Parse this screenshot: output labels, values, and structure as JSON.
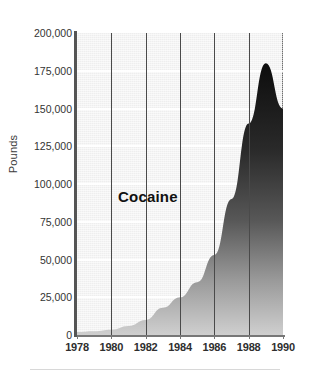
{
  "chart_data": {
    "type": "area",
    "title": "",
    "subtitle": "",
    "series_label": "Cocaine",
    "xlabel": "",
    "ylabel": "Pounds",
    "grid": true,
    "legend_position": "inside-plot",
    "xlim": [
      1978,
      1990
    ],
    "ylim": [
      0,
      200000
    ],
    "x_tick_labels": [
      "1978",
      "1980",
      "1982",
      "1984",
      "1986",
      "1988",
      "1990"
    ],
    "x_ticks": [
      1978,
      1980,
      1982,
      1984,
      1986,
      1988,
      1990
    ],
    "y_tick_labels": [
      "200,000",
      "175,000",
      "150,000",
      "125,000",
      "100,000",
      "75,000",
      "50,000",
      "25,000",
      "0"
    ],
    "y_ticks": [
      200000,
      175000,
      150000,
      125000,
      100000,
      75000,
      50000,
      25000,
      0
    ],
    "series": [
      {
        "name": "Cocaine",
        "x": [
          1978,
          1979,
          1980,
          1981,
          1982,
          1983,
          1984,
          1985,
          1986,
          1987,
          1988,
          1989,
          1990
        ],
        "values": [
          2000,
          2500,
          3500,
          6000,
          10000,
          18000,
          25000,
          35000,
          53000,
          90000,
          140000,
          180000,
          150000
        ]
      }
    ]
  },
  "axis": {
    "y_title": "Pounds",
    "y_ticks": [
      {
        "label": "200,000",
        "value": 200000
      },
      {
        "label": "175,000",
        "value": 175000
      },
      {
        "label": "150,000",
        "value": 150000
      },
      {
        "label": "125,000",
        "value": 125000
      },
      {
        "label": "100,000",
        "value": 100000
      },
      {
        "label": "75,000",
        "value": 75000
      },
      {
        "label": "50,000",
        "value": 50000
      },
      {
        "label": "25,000",
        "value": 25000
      },
      {
        "label": "0",
        "value": 0
      }
    ],
    "x_ticks": [
      {
        "label": "1978",
        "value": 1978
      },
      {
        "label": "1980",
        "value": 1980
      },
      {
        "label": "1982",
        "value": 1982
      },
      {
        "label": "1984",
        "value": 1984
      },
      {
        "label": "1986",
        "value": 1986
      },
      {
        "label": "1988",
        "value": 1988
      },
      {
        "label": "1990",
        "value": 1990
      }
    ]
  },
  "colors": {
    "plot_background": "#eeeeee",
    "gridline_horizontal": "#ffffff",
    "gridline_vertical": "#4a4a4a",
    "area_fill_top": "#111111",
    "area_fill_bottom": "#d0d0d0",
    "axis": "#555555",
    "text": "#2e2e2e"
  }
}
